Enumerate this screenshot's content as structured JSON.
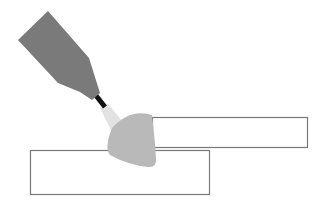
{
  "diagram": {
    "type": "welding-illustration",
    "elements": [
      "welding-torch",
      "torch-nozzle",
      "arc-glow",
      "weld-bead",
      "top-plate",
      "bottom-plate"
    ],
    "colors": {
      "torch": "#7a7a7a",
      "nozzle": "#111111",
      "glow": "#e2e2e2",
      "bead": "#b9b9b9",
      "plate_stroke": "#777777",
      "plate_fill": "#ffffff"
    }
  }
}
